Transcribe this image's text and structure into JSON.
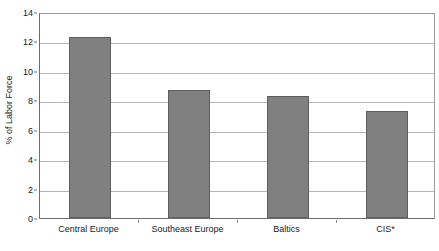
{
  "chart_data": {
    "type": "bar",
    "title": "",
    "xlabel": "",
    "ylabel": "% of Labor Force",
    "categories": [
      "Central Europe",
      "Southeast Europe",
      "Baltics",
      "CIS*"
    ],
    "values": [
      12.3,
      8.7,
      8.3,
      7.3
    ],
    "ylim": [
      0,
      14
    ],
    "ytick_values": [
      0,
      2,
      4,
      6,
      8,
      10,
      12,
      14
    ],
    "ytick_labels": [
      "0",
      "2",
      "4",
      "6",
      "8",
      "10",
      "12",
      "14"
    ],
    "grid": true,
    "legend": null,
    "bar_color": "#808080",
    "bar_edge_color": "#5d5d5d",
    "gridline_color": "#b5b5b5",
    "axis_color": "#6e6e6e",
    "background": "#ffffff"
  }
}
